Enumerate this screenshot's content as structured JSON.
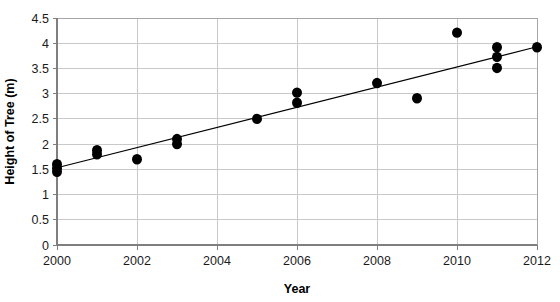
{
  "chart_data": {
    "type": "scatter",
    "title": "",
    "xlabel": "Year",
    "ylabel": "Height of Tree (m)",
    "xlim": [
      2000,
      2012
    ],
    "ylim": [
      0,
      4.5
    ],
    "grid": true,
    "legend": "none",
    "x_ticks": [
      "2000",
      "2002",
      "2004",
      "2006",
      "2008",
      "2010",
      "2012"
    ],
    "x_tick_values": [
      2000,
      2002,
      2004,
      2006,
      2008,
      2010,
      2012
    ],
    "x_minor_step": 1,
    "y_ticks": [
      "0",
      "0.5",
      "1",
      "1.5",
      "2",
      "2.5",
      "3",
      "3.5",
      "4",
      "4.5"
    ],
    "y_tick_values": [
      0,
      0.5,
      1,
      1.5,
      2,
      2.5,
      3,
      3.5,
      4,
      4.5
    ],
    "series": [
      {
        "name": "Height of Tree",
        "marker": "filled-circle",
        "color": "#000000",
        "points": [
          {
            "x": 2000,
            "y": 1.45
          },
          {
            "x": 2000,
            "y": 1.52
          },
          {
            "x": 2000,
            "y": 1.6
          },
          {
            "x": 2001,
            "y": 1.8
          },
          {
            "x": 2001,
            "y": 1.88
          },
          {
            "x": 2002,
            "y": 1.7
          },
          {
            "x": 2003,
            "y": 2.0
          },
          {
            "x": 2003,
            "y": 2.1
          },
          {
            "x": 2005,
            "y": 2.5
          },
          {
            "x": 2006,
            "y": 2.82
          },
          {
            "x": 2006,
            "y": 3.02
          },
          {
            "x": 2008,
            "y": 3.21
          },
          {
            "x": 2009,
            "y": 2.91
          },
          {
            "x": 2010,
            "y": 4.21
          },
          {
            "x": 2011,
            "y": 3.51
          },
          {
            "x": 2011,
            "y": 3.73
          },
          {
            "x": 2011,
            "y": 3.92
          },
          {
            "x": 2012,
            "y": 3.92
          }
        ]
      }
    ],
    "trendline": {
      "name": "linear fit",
      "color": "#000000",
      "x_start": 2000,
      "y_start": 1.53,
      "x_end": 2012,
      "y_end": 3.93
    },
    "colors": {
      "marker": "#000000",
      "trendline": "#000000",
      "gridline": "#c9c9c9",
      "axis": "#7f7f7f",
      "background": "#ffffff",
      "text": "#1a1a1a"
    }
  }
}
